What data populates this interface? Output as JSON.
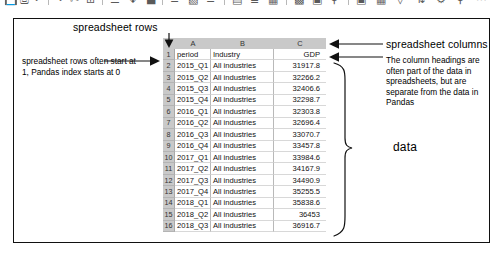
{
  "toolbar_strip": {
    "description": "cut-off application toolbar icons at top of screenshot",
    "icons": [
      "save-icon",
      "print-icon",
      "undo-icon",
      "redo-icon",
      "cut-icon",
      "copy-icon",
      "paste-icon",
      "format-painter-icon",
      "bold-icon",
      "italic-icon",
      "underline-icon",
      "align-left-icon",
      "align-center-icon",
      "align-right-icon",
      "table-icon",
      "chart-icon",
      "image-icon",
      "zoom-icon",
      "help-icon"
    ]
  },
  "annotations": {
    "rows_title": "spreadsheet rows",
    "columns_title": "spreadsheet columns",
    "left_note": "spreadsheet rows often start at 1, Pandas index starts at 0",
    "right_note": "The column headings are often part of the data in spreadsheets, but are separate from the data in Pandas",
    "data_label": "data"
  },
  "spreadsheet": {
    "column_letters": [
      "",
      "A",
      "B",
      "C"
    ],
    "row_numbers": [
      "1",
      "2",
      "3",
      "4",
      "5",
      "6",
      "7",
      "8",
      "9",
      "10",
      "11",
      "12",
      "13",
      "14",
      "15",
      "16"
    ],
    "rows": [
      {
        "n": "1",
        "a": "period",
        "b": "Industry",
        "c": "GDP"
      },
      {
        "n": "2",
        "a": "2015_Q1",
        "b": "All industries",
        "c": "31917.8"
      },
      {
        "n": "3",
        "a": "2015_Q2",
        "b": "All industries",
        "c": "32266.2"
      },
      {
        "n": "4",
        "a": "2015_Q3",
        "b": "All industries",
        "c": "32406.6"
      },
      {
        "n": "5",
        "a": "2015_Q4",
        "b": "All industries",
        "c": "32298.7"
      },
      {
        "n": "6",
        "a": "2016_Q1",
        "b": "All industries",
        "c": "32303.8"
      },
      {
        "n": "7",
        "a": "2016_Q2",
        "b": "All industries",
        "c": "32696.4"
      },
      {
        "n": "8",
        "a": "2016_Q3",
        "b": "All industries",
        "c": "33070.7"
      },
      {
        "n": "9",
        "a": "2016_Q4",
        "b": "All industries",
        "c": "33457.8"
      },
      {
        "n": "10",
        "a": "2017_Q1",
        "b": "All industries",
        "c": "33984.6"
      },
      {
        "n": "11",
        "a": "2017_Q2",
        "b": "All industries",
        "c": "34167.9"
      },
      {
        "n": "12",
        "a": "2017_Q3",
        "b": "All industries",
        "c": "34490.9"
      },
      {
        "n": "13",
        "a": "2017_Q4",
        "b": "All industries",
        "c": "35255.5"
      },
      {
        "n": "14",
        "a": "2018_Q1",
        "b": "All industries",
        "c": "35838.6"
      },
      {
        "n": "15",
        "a": "2018_Q2",
        "b": "All industries",
        "c": "36453"
      },
      {
        "n": "16",
        "a": "2018_Q3",
        "b": "All industries",
        "c": "36916.7"
      }
    ]
  },
  "colors": {
    "header_band": "#c9c9c9",
    "frame": "#111111",
    "grid_line": "#b9b9b9",
    "text": "#000000"
  }
}
